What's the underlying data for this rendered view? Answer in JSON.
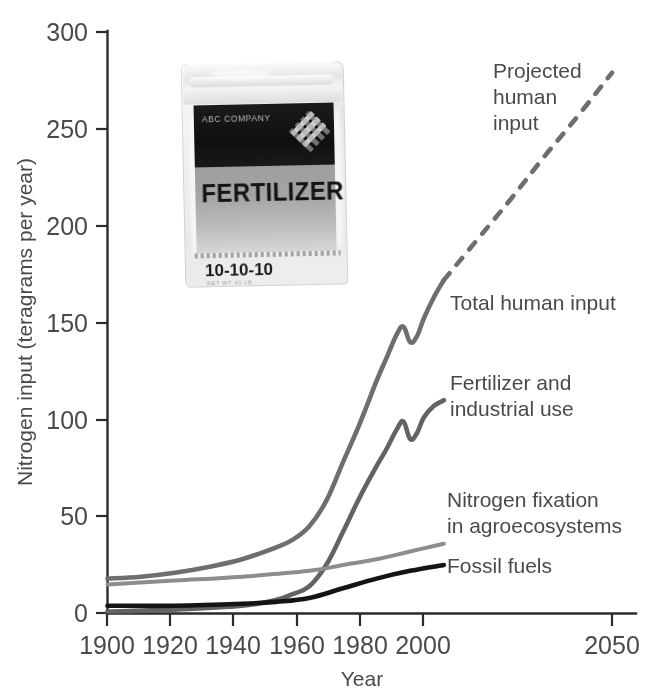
{
  "chart_data": {
    "type": "line",
    "title": "",
    "xlabel": "Year",
    "ylabel": "Nitrogen input (teragrams per year)",
    "xlim": [
      1900,
      2055
    ],
    "ylim": [
      0,
      300
    ],
    "xticks": [
      1900,
      1920,
      1940,
      1960,
      1980,
      2000,
      2050
    ],
    "yticks": [
      0,
      50,
      100,
      150,
      200,
      250,
      300
    ],
    "grid": false,
    "legend_position": "inline-right-of-curves",
    "series": [
      {
        "name": "Total human input",
        "color": "#6e6e6e",
        "style": "solid",
        "x": [
          1900,
          1910,
          1920,
          1930,
          1940,
          1950,
          1955,
          1960,
          1965,
          1970,
          1975,
          1980,
          1983,
          1986,
          1988,
          1990,
          1992,
          1994,
          1997,
          2000
        ],
        "y": [
          18,
          19,
          21,
          24,
          28,
          34,
          38,
          45,
          58,
          78,
          98,
          120,
          132,
          144,
          148,
          140,
          143,
          152,
          163,
          172
        ]
      },
      {
        "name": "Projected human input",
        "color": "#6e6e6e",
        "style": "dashed",
        "x": [
          2000,
          2010,
          2020,
          2030,
          2040,
          2050
        ],
        "y": [
          172,
          193,
          214,
          236,
          257,
          279
        ]
      },
      {
        "name": "Fertilizer and industrial use",
        "color": "#636363",
        "style": "solid",
        "x": [
          1900,
          1920,
          1940,
          1950,
          1955,
          1960,
          1965,
          1970,
          1975,
          1980,
          1983,
          1986,
          1988,
          1990,
          1992,
          1994,
          1997,
          2000
        ],
        "y": [
          1,
          2,
          4,
          7,
          10,
          14,
          25,
          42,
          60,
          76,
          85,
          95,
          99,
          90,
          93,
          101,
          107,
          110
        ]
      },
      {
        "name": "Nitrogen fixation in agroecosystems",
        "color": "#8d8d8d",
        "style": "solid",
        "x": [
          1900,
          1920,
          1940,
          1960,
          1970,
          1980,
          1990,
          2000
        ],
        "y": [
          15,
          17,
          19,
          22,
          25,
          28,
          32,
          36
        ]
      },
      {
        "name": "Fossil fuels",
        "color": "#141414",
        "style": "solid",
        "x": [
          1900,
          1920,
          1940,
          1950,
          1960,
          1970,
          1980,
          1990,
          2000
        ],
        "y": [
          4,
          4,
          5,
          6,
          8,
          13,
          18,
          22,
          25
        ]
      }
    ],
    "annotations": [
      {
        "text_lines": [
          "Projected",
          "human",
          "input"
        ],
        "x": 493,
        "y": 78
      },
      {
        "text_lines": [
          "Total human input"
        ],
        "x": 450,
        "y": 310
      },
      {
        "text_lines": [
          "Fertilizer and",
          "industrial use"
        ],
        "x": 450,
        "y": 390
      },
      {
        "text_lines": [
          "Nitrogen fixation",
          "in agroecosystems"
        ],
        "x": 447,
        "y": 507
      },
      {
        "text_lines": [
          "Fossil fuels"
        ],
        "x": 447,
        "y": 573
      }
    ]
  },
  "axes": {
    "y_title": "Nitrogen input (teragrams per year)",
    "x_title": "Year",
    "y_tick_labels": [
      "300",
      "250",
      "200",
      "150",
      "100",
      "50",
      "0"
    ],
    "x_tick_labels": [
      "1900",
      "1920",
      "1940",
      "1960",
      "1980",
      "2000",
      "2050"
    ]
  },
  "labels": {
    "projected_1": "Projected",
    "projected_2": "human",
    "projected_3": "input",
    "total_human_input": "Total human input",
    "fertilizer_1": "Fertilizer and",
    "fertilizer_2": "industrial use",
    "nfix_1": "Nitrogen fixation",
    "nfix_2": "in agroecosystems",
    "fossil_fuels": "Fossil fuels"
  },
  "bag_image": {
    "company": "ABC COMPANY",
    "product": "FERTILIZER",
    "npk": "10-10-10",
    "fine_print": "NET WT 40 LB"
  },
  "colors": {
    "total": "#6e6e6e",
    "fertilizer": "#636363",
    "nfix": "#8d8d8d",
    "fossil": "#141414",
    "axis": "#2b2b2b",
    "text": "#4a4a4a",
    "background": "#ffffff"
  }
}
